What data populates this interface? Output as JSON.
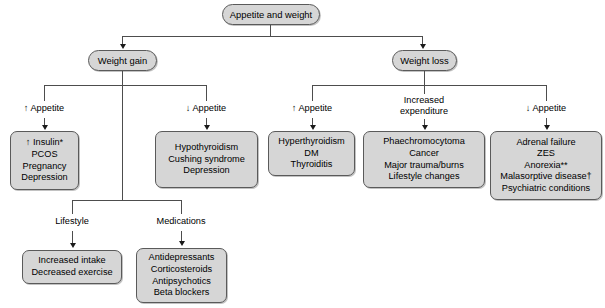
{
  "diagram": {
    "title": "Appetite and weight",
    "root": {
      "label": "Appetite and weight"
    },
    "branches": {
      "weight_gain": {
        "label": "Weight gain"
      },
      "weight_loss": {
        "label": "Weight loss"
      }
    },
    "edge_labels": {
      "gain_increased_appetite": "↑ Appetite",
      "gain_decreased_appetite": "↓ Appetite",
      "loss_increased_appetite": "↑ Appetite",
      "loss_increased_expenditure_line1": "Increased",
      "loss_increased_expenditure_line2": "expenditure",
      "loss_decreased_appetite": "↓ Appetite",
      "lifestyle": "Lifestyle",
      "medications": "Medications"
    },
    "boxes": {
      "gain_increased_appetite_causes": [
        "↑ Insulin*",
        "PCOS",
        "Pregnancy",
        "Depression"
      ],
      "gain_decreased_appetite_causes": [
        "Hypothyroidism",
        "Cushing syndrome",
        "Depression"
      ],
      "lifestyle_causes": [
        "Increased intake",
        "Decreased exercise"
      ],
      "medications_causes": [
        "Antidepressants",
        "Corticosteroids",
        "Antipsychotics",
        "Beta blockers"
      ],
      "loss_increased_appetite_causes": [
        "Hyperthyroidism",
        "DM",
        "Thyroiditis"
      ],
      "loss_increased_expenditure_causes": [
        "Phaechromocytoma",
        "Cancer",
        "Major trauma/burns",
        "Lifestyle changes"
      ],
      "loss_decreased_appetite_causes": [
        "Adrenal failure",
        "ZES",
        "Anorexia**",
        "Malasorptive disease†",
        "Psychiatric conditions"
      ]
    },
    "colors": {
      "box_fill": "#d6d6d6",
      "box_border": "#5a5a5a",
      "connector": "#4d4d4d",
      "text": "#000000",
      "background": "#ffffff"
    }
  }
}
